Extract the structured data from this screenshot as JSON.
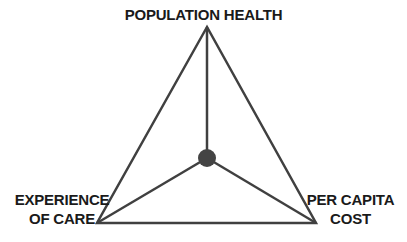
{
  "diagram": {
    "nodes": [
      {
        "id": "top",
        "label": "POPULATION HEALTH"
      },
      {
        "id": "left",
        "label_line1": "EXPERIENCE",
        "label_line2": "OF CARE"
      },
      {
        "id": "right",
        "label_line1": "PER CAPITA",
        "label_line2": "COST"
      }
    ],
    "center": {
      "shape": "circle",
      "color": "#444444"
    },
    "colors": {
      "line": "#404040",
      "text": "#1a1a1a",
      "background": "#ffffff"
    }
  }
}
